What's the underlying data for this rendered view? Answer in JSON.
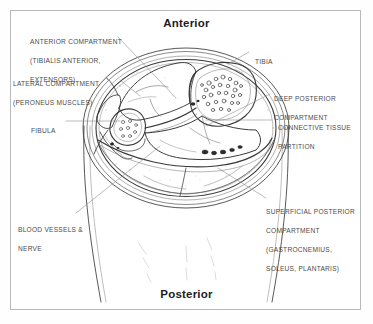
{
  "figure": {
    "kind": "anatomical-cross-section",
    "region": "lower leg (mid-calf) transverse section",
    "orientation": {
      "top_label": "Anterior",
      "bottom_label": "Posterior"
    },
    "frame": {
      "border_color": "#b9b9b9",
      "background": "#ffffff"
    },
    "ink_color": "#3a3a3a",
    "leader_color": "#8d8d8d"
  },
  "labels": {
    "anterior_compartment": {
      "lines": [
        "Anterior Compartment",
        "(Tibialis Anterior,",
        "Extensors)"
      ],
      "text": "Anterior Compartment (Tibialis Anterior, Extensors)"
    },
    "lateral_compartment": {
      "lines": [
        "Lateral Compartment",
        "(Peroneus Muscles)"
      ],
      "text": "Lateral Compartment (Peroneus Muscles)"
    },
    "fibula": {
      "lines": [
        "Fibula"
      ],
      "text": "Fibula"
    },
    "blood_vessels_nerve": {
      "lines": [
        "Blood Vessels &",
        "Nerve"
      ],
      "text": "Blood Vessels & Nerve"
    },
    "tibia": {
      "lines": [
        "Tibia"
      ],
      "text": "Tibia"
    },
    "deep_posterior_compartment": {
      "lines": [
        "Deep Posterior",
        "Compartment"
      ],
      "text": "Deep Posterior Compartment"
    },
    "connective_tissue_partition": {
      "lines": [
        "Connective Tissue",
        "Partition"
      ],
      "text": "Connective Tissue Partition"
    },
    "superficial_posterior_compartment": {
      "lines": [
        "Superficial Posterior",
        "Compartment",
        "(Gastrocnemius,",
        "Soleus, Plantaris)"
      ],
      "text": "Superficial Posterior Compartment (Gastrocnemius, Soleus, Plantaris)"
    }
  }
}
